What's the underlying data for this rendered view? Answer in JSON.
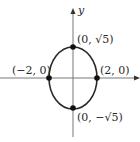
{
  "diagram": {
    "type": "ellipse-graph",
    "equation_hint": "x^2/4 + y^2/5 = 1",
    "axes": {
      "x_label": "",
      "y_label": "y"
    },
    "ellipse": {
      "center": [
        0,
        0
      ],
      "a": 2,
      "b_label": "√5"
    },
    "points": [
      {
        "id": "top",
        "label": "(0, √5)"
      },
      {
        "id": "bottom",
        "label": "(0, −√5)"
      },
      {
        "id": "left",
        "label": "(−2, 0)"
      },
      {
        "id": "right",
        "label": "(2, 0)"
      }
    ],
    "colors": {
      "line": "#2a2a2a",
      "axis": "#666666",
      "point": "#111111"
    }
  }
}
